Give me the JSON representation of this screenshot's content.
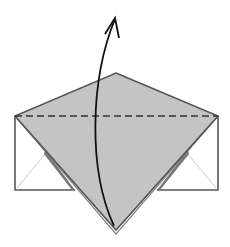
{
  "diagram": {
    "type": "origami-fold-step",
    "description": "Valley-fold the bottom point up along the dashed line",
    "colors": {
      "paper_colored_side": "#c4c4c4",
      "paper_white_side": "#ffffff",
      "outline": "#555555",
      "crease_faint": "#cccccc",
      "arrow": "#111111",
      "dashed_fold_line": "#333333"
    },
    "elements": {
      "fold_line": "dashed valley fold line",
      "arrow": "fold direction arrow (upward)",
      "flap": "gray kite-shaped flap",
      "left_pocket": "left white rectangular flap",
      "right_pocket": "right white rectangular flap"
    }
  }
}
